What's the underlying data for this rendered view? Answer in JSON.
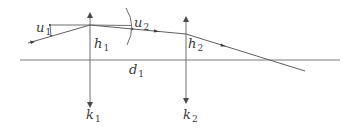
{
  "diagram": {
    "type": "optical-ray-trace",
    "colors": {
      "line": "#6e6e6e",
      "text": "#3a3a3a",
      "background": "#ffffff"
    },
    "optical_axis": {
      "x1": 20,
      "x2": 340,
      "y": 60
    },
    "lenses": [
      {
        "id": "k1",
        "x": 90,
        "top": 13,
        "bottom": 107
      },
      {
        "id": "k2",
        "x": 186,
        "top": 17,
        "bottom": 103
      }
    ],
    "ray_points": [
      [
        28,
        43
      ],
      [
        90,
        25
      ],
      [
        132,
        29
      ],
      [
        186,
        34
      ],
      [
        305,
        71
      ]
    ],
    "labels": {
      "u1": {
        "base": "u",
        "sub": "1"
      },
      "u2": {
        "base": "u",
        "sub": "2"
      },
      "h1": {
        "base": "h",
        "sub": "1"
      },
      "h2": {
        "base": "h",
        "sub": "2"
      },
      "d1": {
        "base": "d",
        "sub": "1"
      },
      "k1": {
        "base": "k",
        "sub": "1"
      },
      "k2": {
        "base": "k",
        "sub": "2"
      }
    }
  }
}
